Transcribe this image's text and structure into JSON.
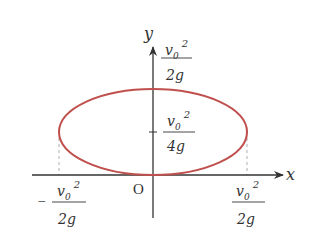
{
  "diagram": {
    "type": "coordinate-diagram",
    "axes": {
      "x_label": "x",
      "y_label": "y",
      "origin_label": "O"
    },
    "curve": {
      "shape": "ellipse",
      "color": "#c0504d",
      "description": "ellipse tangent to x-axis at origin"
    },
    "labels": {
      "top_y": {
        "num_base": "v",
        "num_sub": "0",
        "num_sup": "2",
        "den": "2g"
      },
      "center_y": {
        "num_base": "v",
        "num_sub": "0",
        "num_sup": "2",
        "den": "4g"
      },
      "left_x": {
        "sign": "−",
        "num_base": "v",
        "num_sub": "0",
        "num_sup": "2",
        "den": "2g"
      },
      "right_x": {
        "num_base": "v",
        "num_sub": "0",
        "num_sup": "2",
        "den": "2g"
      }
    },
    "colors": {
      "axis": "#333333",
      "curve": "#c0504d",
      "dashed": "#999999"
    }
  }
}
